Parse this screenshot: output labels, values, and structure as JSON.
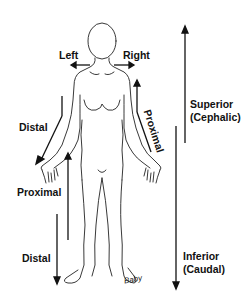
{
  "diagram": {
    "type": "anatomical-directional-terms",
    "labels": {
      "left": "Left",
      "right": "Right",
      "distal_arm": "Distal",
      "proximal_arm": "Proximal",
      "proximal_leg": "Proximal",
      "distal_leg": "Distal",
      "superior": "Superior",
      "superior_alt": "(Cephalic)",
      "inferior": "Inferior",
      "inferior_alt": "(Caudal)"
    },
    "signature": "Baby",
    "colors": {
      "line": "#111111",
      "background": "#ffffff"
    }
  }
}
